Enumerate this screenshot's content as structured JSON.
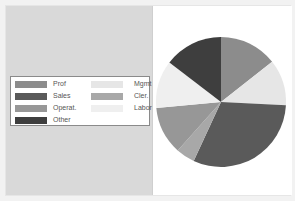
{
  "chart_data": {
    "type": "pie",
    "title": "",
    "categories": [
      "Prof",
      "Mgmt",
      "Sales",
      "Cler.",
      "Operat.",
      "Labor",
      "Other"
    ],
    "values": [
      14.4,
      11.4,
      31.1,
      4.7,
      11.9,
      11.9,
      14.6
    ],
    "unit": "percent (estimated from slice angles)",
    "start_angle_deg": 0,
    "direction": "clockwise from 12 o'clock",
    "colors": {
      "Prof": "#8c8c8c",
      "Mgmt": "#e6e6e6",
      "Sales": "#5a5a5a",
      "Cler.": "#a8a8a8",
      "Operat.": "#979797",
      "Labor": "#efefef",
      "Other": "#3e3e3e"
    },
    "legend_position": "left, vertically centered",
    "legend_layout": "two columns"
  },
  "legend": {
    "items": [
      {
        "label": "Prof",
        "color": "#8c8c8c"
      },
      {
        "label": "Sales",
        "color": "#5a5a5a"
      },
      {
        "label": "Operat.",
        "color": "#979797"
      },
      {
        "label": "Other",
        "color": "#3e3e3e"
      },
      {
        "label": "Mgmt",
        "color": "#e6e6e6"
      },
      {
        "label": "Cler.",
        "color": "#a8a8a8"
      },
      {
        "label": "Labor",
        "color": "#efefef"
      }
    ]
  }
}
